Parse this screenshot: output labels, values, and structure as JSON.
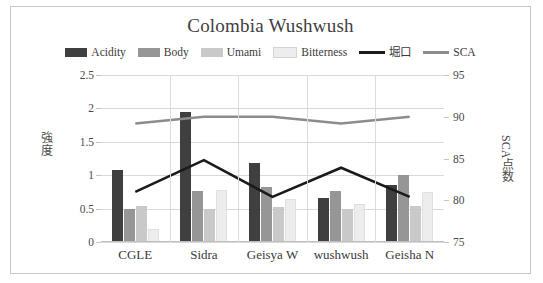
{
  "chart_data": {
    "type": "bar",
    "title": "Colombia Wushwush",
    "categories": [
      "CGLE",
      "Sidra",
      "Geisya W",
      "wushwush",
      "Geisha N"
    ],
    "series": [
      {
        "name": "Acidity",
        "type": "bar",
        "axis": "left",
        "color": "#3f3f3f",
        "values": [
          1.08,
          1.94,
          1.18,
          0.66,
          0.86
        ]
      },
      {
        "name": "Body",
        "type": "bar",
        "axis": "left",
        "color": "#969696",
        "values": [
          0.49,
          0.77,
          0.82,
          0.76,
          1.0
        ]
      },
      {
        "name": "Umami",
        "type": "bar",
        "axis": "left",
        "color": "#c9c9c9",
        "values": [
          0.54,
          0.5,
          0.53,
          0.5,
          0.54
        ]
      },
      {
        "name": "Bitterness",
        "type": "bar",
        "axis": "left",
        "color": "#ededed",
        "values": [
          0.19,
          0.78,
          0.64,
          0.57,
          0.75
        ]
      },
      {
        "name": "堀口",
        "type": "line",
        "axis": "right",
        "color": "#1a1a1a",
        "values": [
          81.0,
          84.8,
          80.4,
          83.9,
          80.4
        ]
      },
      {
        "name": "SCA",
        "type": "line",
        "axis": "right",
        "color": "#8c8c8c",
        "values": [
          89.2,
          90.0,
          90.0,
          89.2,
          90.0
        ]
      }
    ],
    "ylabel": "強度",
    "ylabel_secondary": "SCA点数",
    "xlabel": "",
    "ylim": [
      0,
      2.5
    ],
    "yticks": [
      "0",
      "0.5",
      "1",
      "1.5",
      "2",
      "2.5"
    ],
    "ylim_secondary": [
      75,
      95
    ],
    "yticks_secondary": [
      "75",
      "80",
      "85",
      "90",
      "95"
    ],
    "grid": true,
    "legend_position": "top"
  },
  "legend": {
    "items": [
      {
        "label": "Acidity",
        "marker": "swatch",
        "color": "#3f3f3f"
      },
      {
        "label": "Body",
        "marker": "swatch",
        "color": "#969696"
      },
      {
        "label": "Umami",
        "marker": "swatch",
        "color": "#c9c9c9"
      },
      {
        "label": "Bitterness",
        "marker": "swatch",
        "color": "#ededed"
      },
      {
        "label": "堀口",
        "marker": "line",
        "color": "#1a1a1a"
      },
      {
        "label": "SCA",
        "marker": "line",
        "color": "#8c8c8c"
      }
    ]
  },
  "frame": {
    "border_color": "#c8c8c8",
    "background": "#ffffff"
  }
}
